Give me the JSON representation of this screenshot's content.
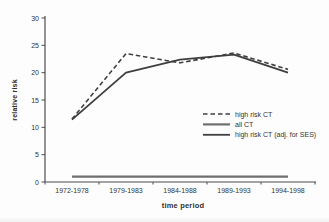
{
  "figure": {
    "background": "#fdfdfd",
    "axis_color": "#4d4d4d",
    "text_color": "#333333"
  },
  "chart_data": {
    "type": "line",
    "title": "",
    "xlabel": "time period",
    "ylabel": "relative risk",
    "categories": [
      "1972-1978",
      "1979-1983",
      "1984-1988",
      "1989-1993",
      "1994-1998"
    ],
    "series": [
      {
        "name": "high risk CT",
        "values": [
          11.5,
          23.5,
          21.8,
          23.6,
          20.6
        ],
        "line_style": "dashed",
        "color": "#3f3f3f",
        "stroke_width": 1.6
      },
      {
        "name": "all CT",
        "values": [
          1,
          1,
          1,
          1,
          1
        ],
        "line_style": "solid",
        "color": "#6f6f6f",
        "stroke_width": 2.2
      },
      {
        "name": "high risk CT (adj. for SES)",
        "values": [
          11.4,
          20,
          22.4,
          23.3,
          20
        ],
        "line_style": "solid",
        "color": "#3f3f3f",
        "stroke_width": 1.8
      }
    ],
    "ylim": [
      0,
      30
    ],
    "yticks": [
      0,
      5,
      10,
      15,
      20,
      25,
      30
    ],
    "grid": false,
    "legend_position": "middle-right"
  }
}
